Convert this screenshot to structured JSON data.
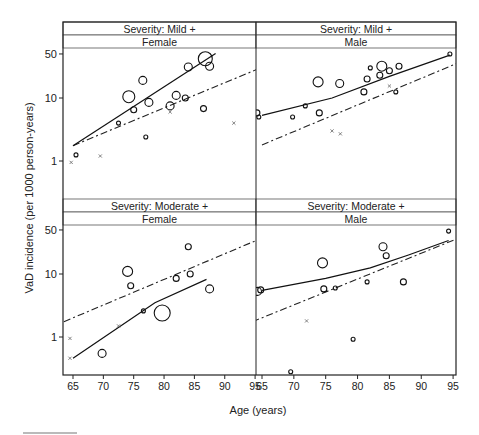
{
  "chart_data": {
    "type": "scatter",
    "title": "",
    "xlabel": "Age (years)",
    "ylabel": "VaD incidence (per 1000 person-years)",
    "yscale": "log",
    "ylim": [
      0.4,
      70
    ],
    "xlim": [
      63.5,
      95.5
    ],
    "x_ticks": [
      65,
      70,
      75,
      80,
      85,
      90,
      95
    ],
    "y_ticks": [
      1,
      10,
      50
    ],
    "grid": false,
    "legend": null,
    "line_styles": {
      "solid": "fitted model (study data)",
      "dashdot": "reference curve"
    },
    "panels": [
      {
        "id": "mild-female",
        "strip_top": "Severity: Mild +",
        "strip_bottom": "Female",
        "circles": [
          {
            "x": 65.5,
            "y": 1.25,
            "r": 2
          },
          {
            "x": 72.5,
            "y": 4.0,
            "r": 2
          },
          {
            "x": 74.2,
            "y": 10.5,
            "r": 6
          },
          {
            "x": 75.0,
            "y": 6.5,
            "r": 3
          },
          {
            "x": 76.5,
            "y": 19.0,
            "r": 4
          },
          {
            "x": 77.0,
            "y": 2.4,
            "r": 2
          },
          {
            "x": 77.5,
            "y": 8.5,
            "r": 4
          },
          {
            "x": 81.0,
            "y": 7.5,
            "r": 4
          },
          {
            "x": 82.0,
            "y": 11.0,
            "r": 4
          },
          {
            "x": 83.5,
            "y": 10.0,
            "r": 3
          },
          {
            "x": 84.0,
            "y": 31.0,
            "r": 4
          },
          {
            "x": 86.5,
            "y": 6.8,
            "r": 3
          },
          {
            "x": 86.8,
            "y": 42.0,
            "r": 7
          },
          {
            "x": 87.5,
            "y": 32.0,
            "r": 4
          }
        ],
        "crosses": [
          {
            "x": 64.7,
            "y": 0.95
          },
          {
            "x": 69.5,
            "y": 1.2
          },
          {
            "x": 81.0,
            "y": 6.0
          },
          {
            "x": 91.5,
            "y": 4.0
          }
        ],
        "solid_line": [
          [
            65,
            1.75
          ],
          [
            88.5,
            51
          ]
        ],
        "dashdot_line": [
          [
            65,
            1.75
          ],
          [
            95.5,
            29
          ]
        ]
      },
      {
        "id": "mild-male",
        "strip_top": "Severity: Mild +",
        "strip_bottom": "Male",
        "circles": [
          {
            "x": 64.2,
            "y": 5.8,
            "r": 3
          },
          {
            "x": 64.5,
            "y": 5.0,
            "r": 2
          },
          {
            "x": 69.8,
            "y": 5.0,
            "r": 2
          },
          {
            "x": 71.8,
            "y": 7.5,
            "r": 2
          },
          {
            "x": 73.8,
            "y": 18.0,
            "r": 5
          },
          {
            "x": 74.0,
            "y": 5.8,
            "r": 3
          },
          {
            "x": 77.2,
            "y": 17.0,
            "r": 4
          },
          {
            "x": 81.0,
            "y": 12.5,
            "r": 3
          },
          {
            "x": 81.5,
            "y": 20.0,
            "r": 3
          },
          {
            "x": 82.0,
            "y": 30.0,
            "r": 2
          },
          {
            "x": 83.5,
            "y": 23.0,
            "r": 3
          },
          {
            "x": 83.8,
            "y": 32.0,
            "r": 5
          },
          {
            "x": 85.0,
            "y": 27.0,
            "r": 3
          },
          {
            "x": 86.5,
            "y": 32.0,
            "r": 3
          },
          {
            "x": 86.0,
            "y": 12.5,
            "r": 2
          },
          {
            "x": 94.5,
            "y": 50.0,
            "r": 2
          }
        ],
        "crosses": [
          {
            "x": 76.0,
            "y": 3.0
          },
          {
            "x": 77.3,
            "y": 2.7
          },
          {
            "x": 85.0,
            "y": 15.5
          }
        ],
        "solid_line": [
          [
            65,
            5.3
          ],
          [
            76,
            10
          ],
          [
            85,
            22
          ],
          [
            94.5,
            48
          ]
        ],
        "dashdot_line": [
          [
            65,
            1.8
          ],
          [
            95.5,
            35
          ]
        ]
      },
      {
        "id": "moderate-female",
        "strip_top": "Severity: Moderate +",
        "strip_bottom": "Female",
        "circles": [
          {
            "x": 69.8,
            "y": 0.55,
            "r": 4
          },
          {
            "x": 74.0,
            "y": 11.0,
            "r": 5
          },
          {
            "x": 74.5,
            "y": 6.5,
            "r": 3
          },
          {
            "x": 76.6,
            "y": 2.6,
            "r": 2
          },
          {
            "x": 79.7,
            "y": 2.4,
            "r": 8
          },
          {
            "x": 82.0,
            "y": 8.5,
            "r": 3
          },
          {
            "x": 84.0,
            "y": 27.0,
            "r": 3
          },
          {
            "x": 84.3,
            "y": 10.0,
            "r": 3
          },
          {
            "x": 87.5,
            "y": 5.8,
            "r": 4
          }
        ],
        "crosses": [
          {
            "x": 64.5,
            "y": 0.95
          },
          {
            "x": 72.5,
            "y": 1.5
          },
          {
            "x": 64.5,
            "y": 0.46
          }
        ],
        "solid_line": [
          [
            65,
            0.46
          ],
          [
            78.5,
            3.5
          ],
          [
            87,
            8.2
          ]
        ],
        "dashdot_line": [
          [
            63.5,
            1.75
          ],
          [
            95.5,
            35
          ]
        ]
      },
      {
        "id": "moderate-male",
        "strip_top": "Severity: Moderate +",
        "strip_bottom": "Male",
        "circles": [
          {
            "x": 64.3,
            "y": 5.3,
            "r": 4
          },
          {
            "x": 64.8,
            "y": 5.6,
            "r": 3
          },
          {
            "x": 69.5,
            "y": 0.28,
            "r": 2
          },
          {
            "x": 74.5,
            "y": 15.0,
            "r": 5
          },
          {
            "x": 74.7,
            "y": 5.8,
            "r": 3
          },
          {
            "x": 76.5,
            "y": 6.0,
            "r": 2
          },
          {
            "x": 79.3,
            "y": 0.92,
            "r": 2
          },
          {
            "x": 81.5,
            "y": 7.5,
            "r": 2
          },
          {
            "x": 84.0,
            "y": 27.0,
            "r": 4
          },
          {
            "x": 84.5,
            "y": 19.5,
            "r": 3
          },
          {
            "x": 87.2,
            "y": 7.5,
            "r": 3
          },
          {
            "x": 94.3,
            "y": 48.0,
            "r": 2
          }
        ],
        "crosses": [
          {
            "x": 72.0,
            "y": 1.8
          }
        ],
        "solid_line": [
          [
            65,
            5.5
          ],
          [
            75,
            8.5
          ],
          [
            82,
            12.5
          ],
          [
            88,
            20
          ],
          [
            94.3,
            34
          ]
        ],
        "dashdot_line": [
          [
            63.5,
            1.75
          ],
          [
            95.5,
            36
          ]
        ]
      }
    ]
  },
  "figure": {
    "xlabel": "Age (years)",
    "ylabel": "VaD incidence (per 1000 person-years)",
    "x_tick_labels": [
      "65",
      "70",
      "75",
      "80",
      "85",
      "90",
      "95"
    ],
    "y_tick_labels": [
      "1",
      "10",
      "50"
    ]
  }
}
